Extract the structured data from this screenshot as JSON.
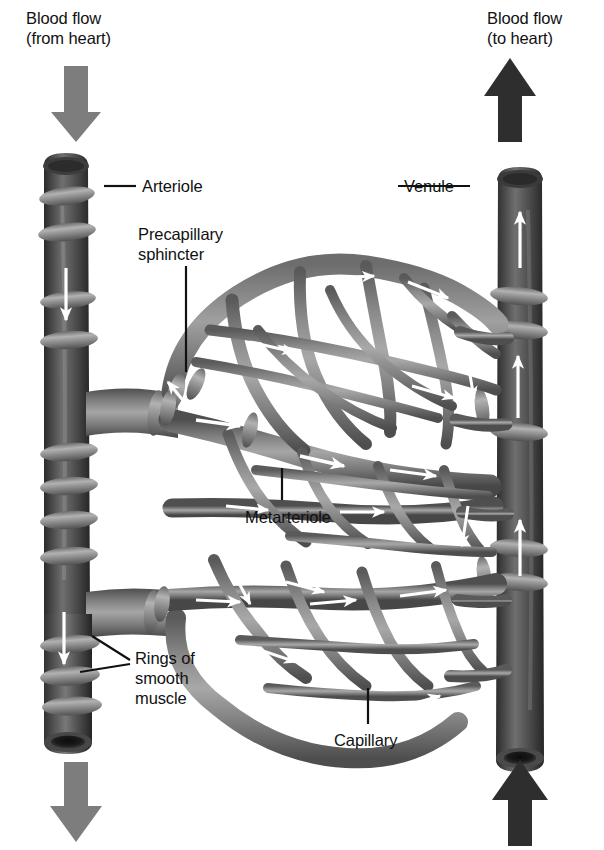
{
  "figure": {
    "background": "#ffffff",
    "width": 604,
    "height": 850
  },
  "palette": {
    "vessel_dark": "#4a4a4a",
    "vessel_darker": "#303030",
    "vessel_mid": "#777777",
    "vessel_light": "#9a9a9a",
    "ring_light": "#aaaaaa",
    "ring_dark": "#5e5e5e",
    "flow_arrow_white": "#ffffff",
    "bulk_arrow_gray": "#7d7d7d",
    "bulk_arrow_black": "#2e2e2e",
    "leader_line": "#111111",
    "text": "#111111"
  },
  "labels": [
    {
      "name": "blood-flow-from-heart",
      "text": "Blood flow\n(from heart)",
      "x": 26,
      "y": 8,
      "align": "left"
    },
    {
      "name": "blood-flow-to-heart",
      "text": "Blood flow\n(to heart)",
      "x": 487,
      "y": 8,
      "align": "left"
    },
    {
      "name": "arteriole",
      "text": "Arteriole",
      "x": 142,
      "y": 176,
      "align": "left"
    },
    {
      "name": "precapillary-sphincter",
      "text": "Precapillary\nsphincter",
      "x": 138,
      "y": 224,
      "align": "left"
    },
    {
      "name": "venule",
      "text": "Venule",
      "x": 404,
      "y": 176,
      "align": "left"
    },
    {
      "name": "metarteriole",
      "text": "Metarteriole",
      "x": 245,
      "y": 507,
      "align": "left"
    },
    {
      "name": "rings-of-smooth-muscle",
      "text": "Rings of\nsmooth\nmuscle",
      "x": 135,
      "y": 648,
      "align": "left"
    },
    {
      "name": "capillary",
      "text": "Capillary",
      "x": 334,
      "y": 730,
      "align": "left"
    }
  ],
  "bulk_arrows": [
    {
      "name": "inflow-arrow-top-left",
      "direction": "down",
      "color": "#7d7d7d",
      "x": 57,
      "y": 66,
      "w": 38,
      "h": 74
    },
    {
      "name": "outflow-arrow-top-right",
      "direction": "up",
      "color": "#2e2e2e",
      "x": 489,
      "y": 58,
      "w": 40,
      "h": 84
    },
    {
      "name": "outflow-arrow-bottom-left",
      "direction": "down",
      "color": "#7d7d7d",
      "x": 58,
      "y": 762,
      "w": 40,
      "h": 80
    },
    {
      "name": "inflow-arrow-bottom-right",
      "direction": "up",
      "color": "#2e2e2e",
      "x": 470,
      "y": 760,
      "w": 42,
      "h": 84
    }
  ],
  "vessels": {
    "arteriole": {
      "name": "arteriole-vessel",
      "description": "Dark vertical trunk on the left carrying blood away from the heart, wrapped in rings of smooth muscle, branching right into the metarteriole.",
      "flow": "downward",
      "rings": 9
    },
    "venule": {
      "name": "venule-vessel",
      "description": "Dark vertical trunk on the right collecting blood back toward the heart, wrapped in rings of smooth muscle.",
      "flow": "upward",
      "rings": 5
    },
    "metarteriole": {
      "name": "metarteriole-vessel",
      "description": "Mid-gray thoroughfare channel crossing the middle from arteriole to venule.",
      "flow": "left-to-right"
    },
    "capillary_bed": {
      "name": "capillary-network",
      "description": "Mesh of thin mid-gray capillaries spanning between the metarteriole branches, with white arrows indicating flow toward the venule.",
      "flow": "left-to-right"
    },
    "precapillary_sphincters": {
      "name": "precapillary-sphincter-rings",
      "description": "Small muscular cuffs at the entrances of capillaries branching from the metarteriole.",
      "count": 3
    }
  },
  "flow_arrows_count": 24
}
